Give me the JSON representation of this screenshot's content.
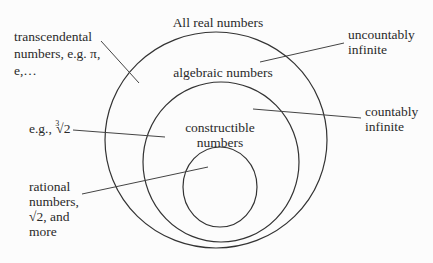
{
  "diagram": {
    "circles": [
      {
        "name": "all-real-numbers",
        "label": "All real numbers",
        "cx": 216,
        "cy": 140,
        "rx": 111,
        "ry": 108
      },
      {
        "name": "algebraic-numbers",
        "label": "algebraic numbers",
        "cx": 221,
        "cy": 162,
        "rx": 78,
        "ry": 80
      },
      {
        "name": "constructible-numbers",
        "label_line1": "constructible",
        "label_line2": "numbers",
        "cx": 220,
        "cy": 187,
        "rx": 37,
        "ry": 40
      }
    ],
    "labels": {
      "all_real": "All real numbers",
      "algebraic": "algebraic numbers",
      "constructible_1": "constructible",
      "constructible_2": "numbers",
      "transcendental_1": "transcendental",
      "transcendental_2": "numbers, e.g. π,",
      "transcendental_3": "e,…",
      "uncountably_1": "uncountably",
      "uncountably_2": "infinite",
      "countably_1": "countably",
      "countably_2": "infinite",
      "cuberoot_prefix": "e.g.,",
      "cuberoot_index": "3",
      "cuberoot_value": "√2",
      "rational_1": "rational",
      "rational_2": "numbers,",
      "rational_3": "√2, and",
      "rational_4": "more"
    },
    "colors": {
      "stroke": "#333333",
      "text": "#2a2a2a",
      "background": "#fcfcfc"
    }
  }
}
